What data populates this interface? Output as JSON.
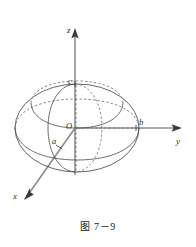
{
  "figure": {
    "caption": "图 7－9",
    "background_color": "#ffffff",
    "width": 196,
    "height": 247
  },
  "axes": [
    {
      "name": "z",
      "label": "z",
      "direction": "up",
      "label_x": 67,
      "label_y": 26
    },
    {
      "name": "y",
      "label": "y",
      "direction": "right",
      "label_x": 176,
      "label_y": 137
    },
    {
      "name": "x",
      "label": "x",
      "direction": "down-left",
      "label_x": 13,
      "label_y": 192
    }
  ],
  "points": [
    {
      "name": "origin",
      "label": "O",
      "label_x": 66,
      "label_y": 122
    },
    {
      "name": "z-intercept",
      "label": "c",
      "label_x": 68,
      "label_y": 77
    },
    {
      "name": "y-intercept",
      "label": "b",
      "label_x": 139,
      "label_y": 118
    },
    {
      "name": "x-intercept",
      "label": "a",
      "label_x": 52,
      "label_y": 137
    }
  ],
  "colors": {
    "axis": "#8e8e8e",
    "arrowhead": "#3a3a3a",
    "outline": "#4a4a4a",
    "hidden": "#6b6b6b",
    "text": "#2b2b2b"
  },
  "shape": {
    "type": "ellipsoid",
    "center_x": 77,
    "center_y": 128,
    "semi_axis_horizontal": 62,
    "semi_axis_vertical": 44,
    "cross_sections": [
      "upper-horizontal-ellipse",
      "equatorial-ellipse",
      "vertical-meridian-ellipse"
    ]
  }
}
